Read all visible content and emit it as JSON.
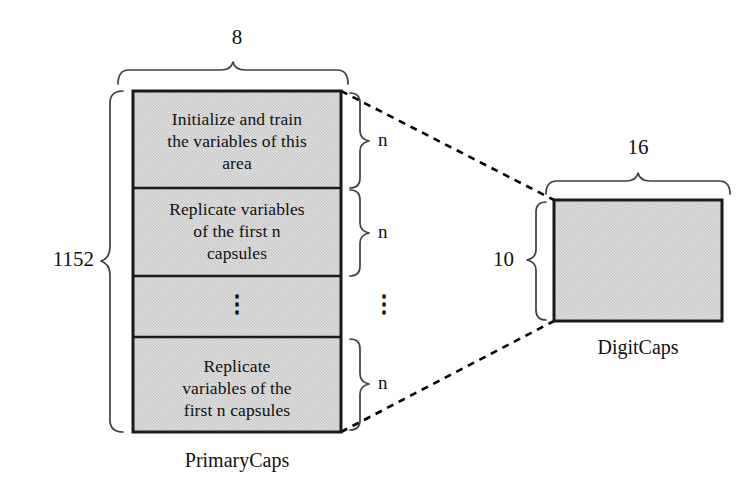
{
  "figure": {
    "colors": {
      "fill": "#d5d5d5",
      "stroke": "#1a1a1a",
      "brace": "#3a3a3a",
      "dashed": "#000000",
      "background": "#ffffff"
    },
    "primary_caps": {
      "name": "PrimaryCaps",
      "label": "PrimaryCaps",
      "width_label": "8",
      "height_label": "1152",
      "cells": [
        {
          "id": "cell-initialize",
          "lines": [
            "Initialize and train",
            "the variables of this",
            "area"
          ],
          "group_label": "n"
        },
        {
          "id": "cell-replicate-1",
          "lines": [
            "Replicate variables",
            "of the first n",
            "capsules"
          ],
          "group_label": "n"
        },
        {
          "id": "cell-ellipsis",
          "lines": [
            "⋮"
          ],
          "group_label": "⋮"
        },
        {
          "id": "cell-replicate-2",
          "lines": [
            "Replicate",
            "variables of the",
            "first n capsules"
          ],
          "group_label": "n"
        }
      ]
    },
    "digit_caps": {
      "name": "DigitCaps",
      "label": "DigitCaps",
      "width_label": "16",
      "height_label": "10"
    },
    "connectors": [
      {
        "id": "connector-top",
        "from": "primarycaps-top-right",
        "to": "digitcaps-top-left",
        "style": "dashed"
      },
      {
        "id": "connector-bottom",
        "from": "primarycaps-bottom-right",
        "to": "digitcaps-bottom-left",
        "style": "dashed"
      }
    ]
  }
}
